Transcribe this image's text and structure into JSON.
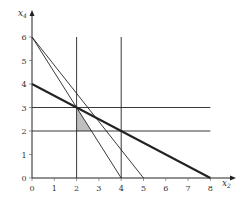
{
  "chart_data": {
    "type": "line",
    "title": "",
    "xlabel": "x2",
    "ylabel": "x4",
    "xlim": [
      0,
      8
    ],
    "ylim": [
      0,
      6
    ],
    "x_ticks": [
      "0",
      "1",
      "2",
      "3",
      "4",
      "5",
      "6",
      "7",
      "8"
    ],
    "y_ticks": [
      "0",
      "1",
      "2",
      "3",
      "4",
      "5",
      "6"
    ],
    "grid": false,
    "series": [
      {
        "name": "x2 + 2x4 = 8",
        "style": "thick",
        "points": [
          [
            0,
            4
          ],
          [
            8,
            0
          ]
        ]
      },
      {
        "name": "3x2 + 2x4 = 12",
        "style": "thin",
        "points": [
          [
            0,
            6
          ],
          [
            4,
            0
          ]
        ]
      },
      {
        "name": "6x2 + 5x4 = 30",
        "style": "thin",
        "points": [
          [
            0,
            6
          ],
          [
            5,
            0
          ]
        ]
      },
      {
        "name": "x2 = 2",
        "style": "thin",
        "points": [
          [
            2,
            0
          ],
          [
            2,
            6
          ]
        ]
      },
      {
        "name": "x2 = 4",
        "style": "thin",
        "points": [
          [
            4,
            0
          ],
          [
            4,
            6
          ]
        ]
      },
      {
        "name": "x4 = 2",
        "style": "thin",
        "points": [
          [
            0,
            2
          ],
          [
            8,
            2
          ]
        ]
      },
      {
        "name": "x4 = 3",
        "style": "thin",
        "points": [
          [
            0,
            3
          ],
          [
            8,
            3
          ]
        ]
      }
    ],
    "shaded_region": {
      "points": [
        [
          2,
          3
        ],
        [
          2,
          2
        ],
        [
          2.667,
          2
        ]
      ],
      "color": "#bfbfbf"
    },
    "colors": {
      "line": "#222222",
      "axis": "#222222",
      "shade": "#bfbfbf"
    }
  }
}
